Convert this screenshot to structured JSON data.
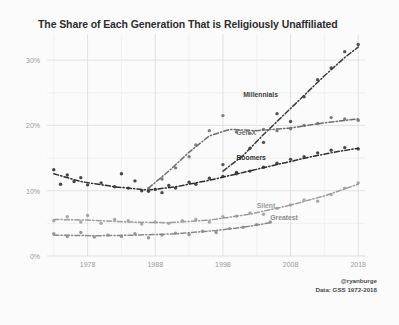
{
  "chart_data": {
    "type": "scatter",
    "title": "The Share of Each Generation That is Religiously Unaffiliated",
    "xlabel": "",
    "ylabel": "",
    "xlim": [
      1972,
      2019
    ],
    "ylim": [
      0,
      34
    ],
    "grid": true,
    "legend_position": "inline-annotations",
    "x_ticks": [
      1978,
      1988,
      1998,
      2008,
      2018
    ],
    "x_tick_labels": [
      "1978",
      "1988",
      "1998",
      "2008",
      "2018"
    ],
    "y_ticks": [
      0,
      10,
      20,
      30
    ],
    "y_tick_labels": [
      "0%",
      "10%",
      "20%",
      "30%"
    ],
    "y_minor_ticks": [
      5,
      15,
      25
    ],
    "series": [
      {
        "name": "Millennials",
        "color": "#3b3b3b",
        "label_x": 2001,
        "label_y": 25.2,
        "points": [
          {
            "x": 1998,
            "y": 14.0
          },
          {
            "x": 2000,
            "y": 12.6
          },
          {
            "x": 2002,
            "y": 16.5
          },
          {
            "x": 2004,
            "y": 17.4
          },
          {
            "x": 2006,
            "y": 21.8
          },
          {
            "x": 2008,
            "y": 20.6
          },
          {
            "x": 2010,
            "y": 24.4
          },
          {
            "x": 2012,
            "y": 27.0
          },
          {
            "x": 2014,
            "y": 28.8
          },
          {
            "x": 2016,
            "y": 31.3
          },
          {
            "x": 2018,
            "y": 32.4
          }
        ],
        "trend": [
          {
            "x": 1998,
            "y": 13.0
          },
          {
            "x": 2001,
            "y": 15.4
          },
          {
            "x": 2004,
            "y": 18.6
          },
          {
            "x": 2007,
            "y": 21.6
          },
          {
            "x": 2010,
            "y": 24.6
          },
          {
            "x": 2013,
            "y": 27.6
          },
          {
            "x": 2016,
            "y": 30.4
          },
          {
            "x": 2018,
            "y": 32.0
          }
        ]
      },
      {
        "name": "Gen X",
        "color": "#6d6d6d",
        "label_x": 2000,
        "label_y": 19.4,
        "points": [
          {
            "x": 1987,
            "y": 10.3
          },
          {
            "x": 1989,
            "y": 11.8
          },
          {
            "x": 1991,
            "y": 13.5
          },
          {
            "x": 1993,
            "y": 15.2
          },
          {
            "x": 1994,
            "y": 17.0
          },
          {
            "x": 1996,
            "y": 19.2
          },
          {
            "x": 1998,
            "y": 21.5
          },
          {
            "x": 2000,
            "y": 19.0
          },
          {
            "x": 2002,
            "y": 18.8
          },
          {
            "x": 2004,
            "y": 19.4
          },
          {
            "x": 2006,
            "y": 19.2
          },
          {
            "x": 2008,
            "y": 19.5
          },
          {
            "x": 2010,
            "y": 20.0
          },
          {
            "x": 2012,
            "y": 20.3
          },
          {
            "x": 2014,
            "y": 21.2
          },
          {
            "x": 2016,
            "y": 21.0
          },
          {
            "x": 2018,
            "y": 20.8
          }
        ],
        "trend": [
          {
            "x": 1987,
            "y": 10.4
          },
          {
            "x": 1990,
            "y": 13.0
          },
          {
            "x": 1993,
            "y": 15.9
          },
          {
            "x": 1996,
            "y": 18.4
          },
          {
            "x": 1999,
            "y": 19.4
          },
          {
            "x": 2003,
            "y": 19.2
          },
          {
            "x": 2008,
            "y": 19.6
          },
          {
            "x": 2013,
            "y": 20.4
          },
          {
            "x": 2018,
            "y": 21.0
          }
        ]
      },
      {
        "name": "Boomers",
        "color": "#2f2f2f",
        "label_x": 2000,
        "label_y": 15.6,
        "points": [
          {
            "x": 1973,
            "y": 13.2
          },
          {
            "x": 1974,
            "y": 11.0
          },
          {
            "x": 1975,
            "y": 12.4
          },
          {
            "x": 1976,
            "y": 11.4
          },
          {
            "x": 1977,
            "y": 12.0
          },
          {
            "x": 1978,
            "y": 10.9
          },
          {
            "x": 1980,
            "y": 11.2
          },
          {
            "x": 1982,
            "y": 10.6
          },
          {
            "x": 1983,
            "y": 12.6
          },
          {
            "x": 1984,
            "y": 10.4
          },
          {
            "x": 1985,
            "y": 11.5
          },
          {
            "x": 1986,
            "y": 10.0
          },
          {
            "x": 1987,
            "y": 9.9
          },
          {
            "x": 1988,
            "y": 10.2
          },
          {
            "x": 1989,
            "y": 9.7
          },
          {
            "x": 1990,
            "y": 10.8
          },
          {
            "x": 1991,
            "y": 10.4
          },
          {
            "x": 1993,
            "y": 11.3
          },
          {
            "x": 1994,
            "y": 11.0
          },
          {
            "x": 1996,
            "y": 11.9
          },
          {
            "x": 1998,
            "y": 12.2
          },
          {
            "x": 2000,
            "y": 12.8
          },
          {
            "x": 2002,
            "y": 13.0
          },
          {
            "x": 2004,
            "y": 13.6
          },
          {
            "x": 2006,
            "y": 14.2
          },
          {
            "x": 2008,
            "y": 14.8
          },
          {
            "x": 2010,
            "y": 15.2
          },
          {
            "x": 2012,
            "y": 15.8
          },
          {
            "x": 2014,
            "y": 16.2
          },
          {
            "x": 2016,
            "y": 16.6
          },
          {
            "x": 2018,
            "y": 16.4
          }
        ],
        "trend": [
          {
            "x": 1973,
            "y": 12.6
          },
          {
            "x": 1977,
            "y": 11.4
          },
          {
            "x": 1982,
            "y": 10.6
          },
          {
            "x": 1987,
            "y": 10.1
          },
          {
            "x": 1991,
            "y": 10.6
          },
          {
            "x": 1996,
            "y": 11.6
          },
          {
            "x": 2001,
            "y": 12.8
          },
          {
            "x": 2006,
            "y": 14.0
          },
          {
            "x": 2011,
            "y": 15.2
          },
          {
            "x": 2015,
            "y": 16.0
          },
          {
            "x": 2018,
            "y": 16.5
          }
        ]
      },
      {
        "name": "Silent",
        "color": "#9c9c9c",
        "label_x": 2003,
        "label_y": 8.2,
        "points": [
          {
            "x": 1973,
            "y": 5.4
          },
          {
            "x": 1975,
            "y": 6.0
          },
          {
            "x": 1977,
            "y": 5.2
          },
          {
            "x": 1978,
            "y": 6.2
          },
          {
            "x": 1980,
            "y": 5.0
          },
          {
            "x": 1982,
            "y": 5.6
          },
          {
            "x": 1984,
            "y": 5.4
          },
          {
            "x": 1986,
            "y": 4.9
          },
          {
            "x": 1988,
            "y": 5.2
          },
          {
            "x": 1990,
            "y": 5.0
          },
          {
            "x": 1992,
            "y": 5.4
          },
          {
            "x": 1994,
            "y": 5.6
          },
          {
            "x": 1996,
            "y": 5.2
          },
          {
            "x": 1998,
            "y": 6.0
          },
          {
            "x": 2000,
            "y": 6.1
          },
          {
            "x": 2002,
            "y": 6.6
          },
          {
            "x": 2004,
            "y": 6.4
          },
          {
            "x": 2006,
            "y": 7.3
          },
          {
            "x": 2008,
            "y": 7.8
          },
          {
            "x": 2010,
            "y": 8.6
          },
          {
            "x": 2012,
            "y": 8.4
          },
          {
            "x": 2014,
            "y": 9.4
          },
          {
            "x": 2016,
            "y": 10.4
          },
          {
            "x": 2018,
            "y": 11.2
          }
        ],
        "trend": [
          {
            "x": 1973,
            "y": 5.6
          },
          {
            "x": 1978,
            "y": 5.5
          },
          {
            "x": 1984,
            "y": 5.2
          },
          {
            "x": 1990,
            "y": 5.1
          },
          {
            "x": 1996,
            "y": 5.5
          },
          {
            "x": 2002,
            "y": 6.4
          },
          {
            "x": 2008,
            "y": 7.8
          },
          {
            "x": 2013,
            "y": 9.2
          },
          {
            "x": 2018,
            "y": 11.0
          }
        ]
      },
      {
        "name": "Greatest",
        "color": "#8a8a8a",
        "label_x": 2005,
        "label_y": 6.4,
        "points": [
          {
            "x": 1973,
            "y": 3.4
          },
          {
            "x": 1975,
            "y": 3.0
          },
          {
            "x": 1977,
            "y": 3.6
          },
          {
            "x": 1979,
            "y": 2.9
          },
          {
            "x": 1981,
            "y": 3.2
          },
          {
            "x": 1983,
            "y": 3.0
          },
          {
            "x": 1985,
            "y": 3.4
          },
          {
            "x": 1987,
            "y": 2.8
          },
          {
            "x": 1989,
            "y": 3.2
          },
          {
            "x": 1991,
            "y": 3.5
          },
          {
            "x": 1993,
            "y": 3.3
          },
          {
            "x": 1995,
            "y": 3.8
          },
          {
            "x": 1997,
            "y": 3.6
          },
          {
            "x": 1999,
            "y": 4.2
          },
          {
            "x": 2001,
            "y": 4.4
          },
          {
            "x": 2003,
            "y": 4.8
          },
          {
            "x": 2005,
            "y": 5.2
          }
        ],
        "trend": [
          {
            "x": 1973,
            "y": 3.2
          },
          {
            "x": 1979,
            "y": 3.1
          },
          {
            "x": 1985,
            "y": 3.2
          },
          {
            "x": 1991,
            "y": 3.4
          },
          {
            "x": 1997,
            "y": 3.9
          },
          {
            "x": 2001,
            "y": 4.4
          },
          {
            "x": 2005,
            "y": 5.1
          }
        ]
      }
    ]
  },
  "credit": {
    "handle": "@ryanburge",
    "source": "Data: GSS 1972-2018"
  }
}
